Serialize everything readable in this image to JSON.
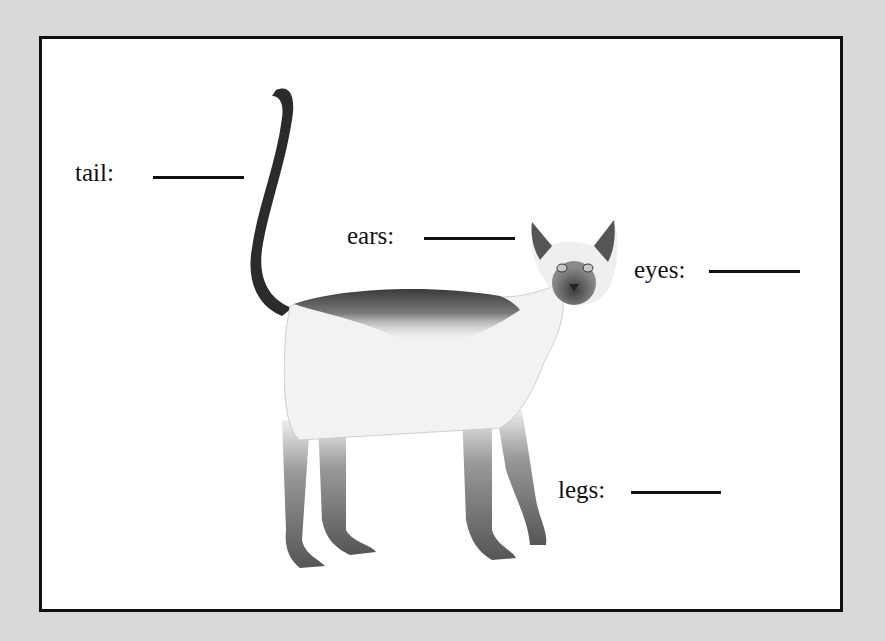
{
  "worksheet": {
    "subject": "Siamese cat body parts",
    "background_color": "#d9d9d9",
    "frame_color": "#111111",
    "labels": [
      {
        "id": "tail",
        "text": "tail:",
        "answer": ""
      },
      {
        "id": "ears",
        "text": "ears:",
        "answer": ""
      },
      {
        "id": "eyes",
        "text": "eyes:",
        "answer": ""
      },
      {
        "id": "legs",
        "text": "legs:",
        "answer": ""
      }
    ]
  }
}
